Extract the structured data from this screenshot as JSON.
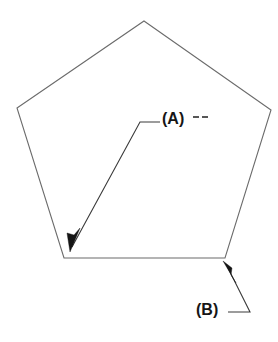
{
  "figure": {
    "background_color": "#ffffff",
    "width": 278,
    "height": 342
  },
  "shape": {
    "name": "pentagon",
    "sides": 5,
    "stroke_color": "#6b6b6b",
    "fill_color": "#ffffff",
    "vertices": [
      {
        "name": "top",
        "x": 144,
        "y": 21
      },
      {
        "name": "right",
        "x": 271,
        "y": 110
      },
      {
        "name": "bottom-right",
        "x": 225,
        "y": 258
      },
      {
        "name": "bottom-left",
        "x": 64,
        "y": 258
      },
      {
        "name": "left",
        "x": 17,
        "y": 108
      }
    ],
    "points_attr": "144,21 271,110 225,258 64,258 17,108"
  },
  "callouts": [
    {
      "id": "a",
      "label": "(A)",
      "target_vertex": "bottom-left",
      "arrow_tip": {
        "x": 70,
        "y": 250
      },
      "leader_path": "M160,122 L140,122 L72,247",
      "arrow_polygon": "70,252 80,228 74,235 67,233",
      "trailing_dashes": [
        {
          "x1": 193,
          "y1": 117,
          "x2": 199,
          "y2": 117
        },
        {
          "x1": 202,
          "y1": 117,
          "x2": 208,
          "y2": 117
        }
      ],
      "label_left": 162,
      "label_top": 111
    },
    {
      "id": "b",
      "label": "(B)",
      "target_vertex": "bottom-right",
      "arrow_tip": {
        "x": 224,
        "y": 262
      },
      "leader_path": "M228,312 L250,312 L227,266",
      "arrow_polygon": "223,261 236,283 231,275 232,268",
      "trailing_dashes": [],
      "label_left": 196,
      "label_top": 302
    }
  ],
  "colors": {
    "shape_stroke": "#6b6b6b",
    "leader_stroke": "#3a3a3a",
    "arrow_fill": "#151515",
    "label_text": "#161616",
    "background": "#ffffff"
  }
}
